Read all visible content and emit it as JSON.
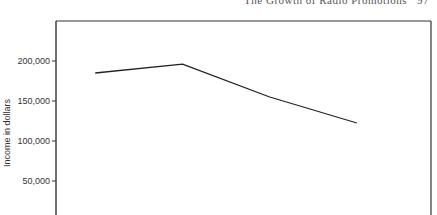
{
  "header": {
    "running_title": "The Growth of Radio Promotions",
    "page_marker": "97"
  },
  "chart_data": {
    "type": "line",
    "title": "",
    "xlabel": "",
    "ylabel": "Income in dollars",
    "ylim": [
      0,
      250000
    ],
    "yticks": [
      50000,
      100000,
      150000,
      200000
    ],
    "ytick_labels": [
      "50,000",
      "100,000",
      "150,000",
      "200,000"
    ],
    "x": [
      1,
      2,
      3,
      4
    ],
    "xlim": [
      0.55,
      4.85
    ],
    "series": [
      {
        "name": "Income",
        "values": [
          185000,
          196000,
          155000,
          122500
        ]
      }
    ],
    "grid": false,
    "legend": "none"
  }
}
